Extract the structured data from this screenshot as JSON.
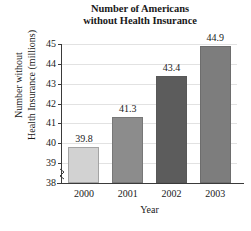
{
  "chart_data": {
    "type": "bar",
    "title": "Number of Americans without Health Insurance",
    "title_lines": [
      "Number of Americans",
      "without Health Insurance"
    ],
    "xlabel": "Year",
    "ylabel": "Number without Health Insurance (millions)",
    "ylabel_lines": [
      "Number without",
      "Health Insurance (millions)"
    ],
    "categories": [
      "2000",
      "2001",
      "2002",
      "2003"
    ],
    "values": [
      39.8,
      41.3,
      43.4,
      44.9
    ],
    "value_labels": [
      "39.8",
      "41.3",
      "43.4",
      "44.9"
    ],
    "ylim": [
      38,
      45
    ],
    "y_ticks": [
      "38",
      "39",
      "40",
      "41",
      "42",
      "43",
      "44",
      "45"
    ],
    "grid": true,
    "legend": "none",
    "axis_break": true,
    "bar_colors": [
      "#d2d2d2",
      "#8c8c8c",
      "#5c5c5c",
      "#7d7d7d"
    ],
    "gridline_color": "#e2e2e2",
    "axis_color": "#3a3a3a"
  }
}
